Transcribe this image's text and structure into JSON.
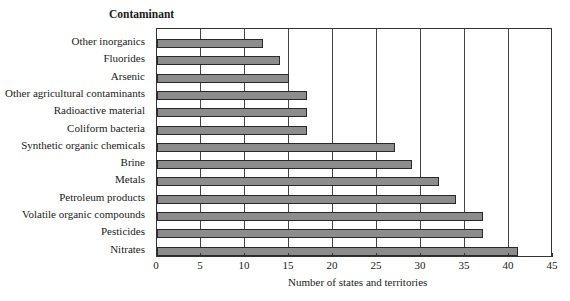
{
  "chart_data": {
    "type": "bar",
    "orientation": "horizontal",
    "title": "Contaminant",
    "xlabel": "Number of states and territories",
    "ylabel": "Contaminant",
    "xlim": [
      0,
      45
    ],
    "xticks": [
      0,
      5,
      10,
      15,
      20,
      25,
      30,
      35,
      40,
      45
    ],
    "grid": true,
    "categories": [
      "Other inorganics",
      "Fluorides",
      "Arsenic",
      "Other agricultural contaminants",
      "Radioactive material",
      "Coliform bacteria",
      "Synthetic organic chemicals",
      "Brine",
      "Metals",
      "Petroleum products",
      "Volatile organic compounds",
      "Pesticides",
      "Nitrates"
    ],
    "values": [
      12,
      14,
      15,
      17,
      17,
      17,
      27,
      29,
      32,
      34,
      37,
      37,
      41
    ],
    "colors": {
      "bar": "#8c8c8c",
      "bar_border": "#2a2a2a",
      "grid": "#444444"
    }
  }
}
